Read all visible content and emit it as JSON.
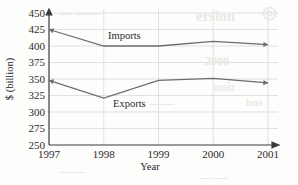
{
  "chart_data": {
    "type": "line",
    "title": "",
    "xlabel": "Year",
    "ylabel": "$ (billion)",
    "categories": [
      "1997",
      "1998",
      "1999",
      "2000",
      "2001"
    ],
    "x": [
      1997,
      1998,
      1999,
      2000,
      2001
    ],
    "xlim": [
      1997,
      2001
    ],
    "ylim": [
      250,
      450
    ],
    "ytick_labels": [
      "450",
      "425",
      "400",
      "375",
      "350",
      "325",
      "300",
      "275",
      "250"
    ],
    "yticks": [
      450,
      425,
      400,
      375,
      350,
      325,
      300,
      275,
      250
    ],
    "ytick_step": 25,
    "grid": true,
    "legend": "inline-labels",
    "series": [
      {
        "name": "Imports",
        "values": [
          425,
          400,
          400,
          407,
          402
        ],
        "color": "#6d6d6d",
        "label_text": "Imports",
        "start_arrow": true,
        "end_arrow": true
      },
      {
        "name": "Exports",
        "values": [
          348,
          321,
          348,
          351,
          344
        ],
        "color": "#6d6d6d",
        "label_text": "Exports",
        "start_arrow": true,
        "end_arrow": true
      }
    ],
    "annotations": [
      "Imports and Exports lines cross between 1999 and 2000 near 375",
      "Both axes terminate in arrowheads"
    ]
  },
  "axes": {
    "y_axis_title": "$ (billion)",
    "x_axis_title": "Year",
    "y_arrow": true,
    "x_arrow": true
  },
  "background_artifacts": {
    "note": "faint scanner bleed-through from reverse page",
    "items": [
      {
        "text": "◎",
        "x": 262,
        "y": 2,
        "size": 17
      },
      {
        "text": "ersion",
        "x": 196,
        "y": 8,
        "size": 15
      },
      {
        "text": "— ——",
        "x": 60,
        "y": 6,
        "size": 12
      },
      {
        "text": "2000",
        "x": 205,
        "y": 54,
        "size": 12
      },
      {
        "text": "noiz",
        "x": 214,
        "y": 80,
        "size": 12
      },
      {
        "text": "——",
        "x": 150,
        "y": 96,
        "size": 12
      },
      {
        "text": "bns",
        "x": 246,
        "y": 96,
        "size": 11
      },
      {
        "text": "——",
        "x": 60,
        "y": 164,
        "size": 12
      },
      {
        "text": "— —",
        "x": 200,
        "y": 170,
        "size": 12
      }
    ]
  }
}
